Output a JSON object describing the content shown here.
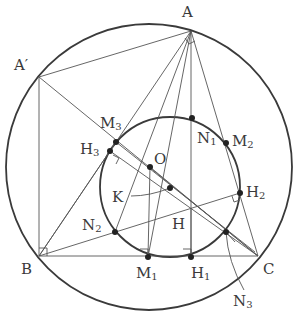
{
  "diagram": {
    "type": "geometry-figure",
    "colors": {
      "stroke": "#3a3a3a",
      "thin_stroke": "#555555",
      "background": "#ffffff"
    },
    "circles": [
      {
        "id": "circumcircle",
        "cx": 149,
        "cy": 167,
        "r": 143,
        "weight": "thick"
      },
      {
        "id": "nine-point-circle",
        "cx": 170,
        "cy": 187,
        "r": 70,
        "weight": "thick"
      }
    ],
    "points": {
      "A": {
        "x": 191,
        "y": 31
      },
      "A_prime": {
        "x": 39,
        "y": 77
      },
      "B": {
        "x": 39,
        "y": 256
      },
      "C": {
        "x": 258,
        "y": 256
      },
      "O": {
        "x": 150,
        "y": 167
      },
      "K": {
        "x": 170,
        "y": 188
      },
      "H": {
        "x": 191,
        "y": 208
      },
      "M1": {
        "x": 148,
        "y": 257
      },
      "M2": {
        "x": 226,
        "y": 143
      },
      "M3": {
        "x": 116,
        "y": 142
      },
      "H1": {
        "x": 191,
        "y": 257
      },
      "H2": {
        "x": 240,
        "y": 193
      },
      "H3": {
        "x": 110,
        "y": 151
      },
      "N1": {
        "x": 192,
        "y": 118
      },
      "N2": {
        "x": 115,
        "y": 232
      },
      "N3": {
        "x": 226,
        "y": 232
      }
    },
    "labels": [
      {
        "id": "A",
        "text": "A",
        "x": 182,
        "y": 5
      },
      {
        "id": "A_prime",
        "text": "A′",
        "x": 14,
        "y": 58
      },
      {
        "id": "B",
        "text": "B",
        "x": 21,
        "y": 262
      },
      {
        "id": "C",
        "text": "C",
        "x": 263,
        "y": 262
      },
      {
        "id": "O",
        "text": "O",
        "x": 154,
        "y": 152
      },
      {
        "id": "K",
        "text": "K",
        "x": 112,
        "y": 190
      },
      {
        "id": "H",
        "text": "H",
        "x": 172,
        "y": 217
      },
      {
        "id": "M1",
        "text": "M",
        "sub": "1",
        "x": 136,
        "y": 266
      },
      {
        "id": "M2",
        "text": "M",
        "sub": "2",
        "x": 232,
        "y": 134
      },
      {
        "id": "M3",
        "text": "M",
        "sub": "3",
        "x": 100,
        "y": 116
      },
      {
        "id": "H1",
        "text": "H",
        "sub": "1",
        "x": 191,
        "y": 266
      },
      {
        "id": "H2",
        "text": "H",
        "sub": "2",
        "x": 246,
        "y": 185
      },
      {
        "id": "H3",
        "text": "H",
        "sub": "3",
        "x": 80,
        "y": 142
      },
      {
        "id": "N1",
        "text": "N",
        "sub": "1",
        "x": 197,
        "y": 131
      },
      {
        "id": "N2",
        "text": "N",
        "sub": "2",
        "x": 82,
        "y": 218
      },
      {
        "id": "N3",
        "text": "N",
        "sub": "3",
        "x": 233,
        "y": 294
      }
    ]
  }
}
